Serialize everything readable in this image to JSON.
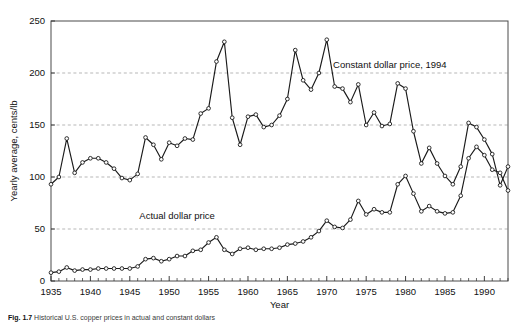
{
  "figure": {
    "caption_label": "Fig. 1.7",
    "caption_text": "Historical U.S. copper prices in actual and constant dollars"
  },
  "chart_data": {
    "type": "line",
    "title": "",
    "xlabel": "Year",
    "ylabel": "Yearly average, cents/lb",
    "xlim": [
      1935,
      1993
    ],
    "ylim": [
      0,
      250
    ],
    "yticks": [
      0,
      50,
      100,
      150,
      200,
      250
    ],
    "ytick_labels": [
      "0",
      "50",
      "100",
      "150",
      "200",
      "250"
    ],
    "xticks": [
      1935,
      1940,
      1945,
      1950,
      1955,
      1960,
      1965,
      1970,
      1975,
      1980,
      1985,
      1990
    ],
    "xtick_labels": [
      "1935",
      "1940",
      "1945",
      "1950",
      "1955",
      "1960",
      "1965",
      "1970",
      "1975",
      "1980",
      "1985",
      "1990"
    ],
    "minor_xtick_interval": 1,
    "grid": "horizontal-dashed",
    "legend_position": "inline-annotations",
    "marker": "open-circle",
    "line_color": "#1a1a1a",
    "grid_color": "#9a9a9a",
    "x": [
      1935,
      1936,
      1937,
      1938,
      1939,
      1940,
      1941,
      1942,
      1943,
      1944,
      1945,
      1946,
      1947,
      1948,
      1949,
      1950,
      1951,
      1952,
      1953,
      1954,
      1955,
      1956,
      1957,
      1958,
      1959,
      1960,
      1961,
      1962,
      1963,
      1964,
      1965,
      1966,
      1967,
      1968,
      1969,
      1970,
      1971,
      1972,
      1973,
      1974,
      1975,
      1976,
      1977,
      1978,
      1979,
      1980,
      1981,
      1982,
      1983,
      1984,
      1985,
      1986,
      1987,
      1988,
      1989,
      1990,
      1991,
      1992,
      1993
    ],
    "series": [
      {
        "name": "Constant dollar price, 1994",
        "label": "Constant dollar price, 1994",
        "values": [
          93,
          100,
          137,
          104,
          114,
          118,
          118,
          114,
          108,
          99,
          97,
          103,
          138,
          131,
          117,
          133,
          130,
          137,
          136,
          161,
          166,
          211,
          230,
          157,
          131,
          158,
          160,
          148,
          150,
          159,
          175,
          222,
          193,
          184,
          200,
          232,
          187,
          185,
          172,
          189,
          150,
          162,
          149,
          151,
          190,
          185,
          144,
          113,
          128,
          113,
          101,
          93,
          110,
          152,
          148,
          136,
          122,
          92,
          110
        ]
      },
      {
        "name": "Actual dollar price",
        "label": "Actual dollar price",
        "values": [
          8,
          9,
          13,
          10,
          11,
          11,
          12,
          12,
          12,
          12,
          12,
          14,
          21,
          22,
          19,
          21,
          24,
          24,
          29,
          30,
          37,
          42,
          30,
          26,
          31,
          32,
          30,
          31,
          31,
          32,
          35,
          36,
          38,
          42,
          48,
          58,
          52,
          51,
          59,
          77,
          64,
          69,
          66,
          66,
          93,
          101,
          84,
          67,
          72,
          67,
          65,
          66,
          82,
          118,
          129,
          121,
          107,
          104,
          87
        ]
      }
    ],
    "annotations": [
      {
        "text": "Constant dollar price, 1994",
        "x": 1978,
        "y": 205
      },
      {
        "text": "Actual dollar price",
        "x": 1951,
        "y": 60
      }
    ]
  }
}
